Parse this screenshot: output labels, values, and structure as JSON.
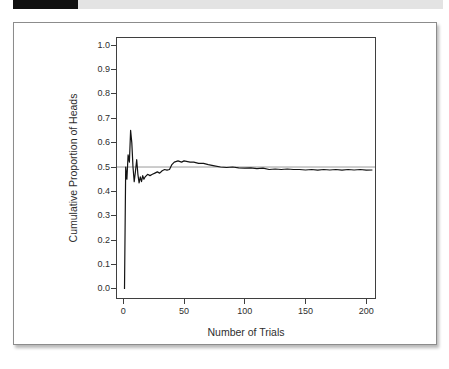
{
  "window": {
    "tab_color": "#101010",
    "bar_color": "#e3e3e3"
  },
  "chart_data": {
    "type": "line",
    "title": "",
    "xlabel": "Number of Trials",
    "ylabel": "Cumulative Proportion of Heads",
    "xlim": [
      -6,
      208
    ],
    "ylim": [
      -0.041,
      1.033
    ],
    "x_ticks": {
      "values": [
        0,
        50,
        100,
        150,
        200
      ],
      "labels": [
        "0",
        "50",
        "100",
        "150",
        "200"
      ]
    },
    "y_ticks": {
      "values": [
        0.0,
        0.1,
        0.2,
        0.3,
        0.4,
        0.5,
        0.6,
        0.7,
        0.8,
        0.9,
        1.0
      ],
      "labels": [
        "0.0",
        "0.1",
        "0.2",
        "0.3",
        "0.4",
        "0.5",
        "0.6",
        "0.7",
        "0.8",
        "0.9",
        "1.0"
      ]
    },
    "grid": false,
    "legend": "none",
    "reference_line_y": 0.5,
    "reference_line_color": "#9a9a9a",
    "line_color": "#141414",
    "frame_color": "#3f3f3f",
    "series": [
      {
        "name": "cumulative-proportion-of-heads",
        "x": [
          1,
          2,
          3,
          4,
          5,
          6,
          7,
          8,
          9,
          10,
          11,
          12,
          13,
          14,
          15,
          16,
          17,
          18,
          20,
          22,
          24,
          26,
          28,
          30,
          32,
          34,
          36,
          38,
          40,
          42,
          45,
          48,
          50,
          55,
          58,
          62,
          66,
          70,
          75,
          80,
          85,
          90,
          95,
          100,
          105,
          110,
          115,
          120,
          125,
          130,
          135,
          140,
          145,
          150,
          155,
          160,
          165,
          170,
          175,
          180,
          185,
          190,
          195,
          200,
          205
        ],
        "y": [
          0.0,
          0.5,
          0.45,
          0.55,
          0.52,
          0.65,
          0.6,
          0.5,
          0.44,
          0.48,
          0.53,
          0.47,
          0.435,
          0.46,
          0.44,
          0.465,
          0.45,
          0.46,
          0.47,
          0.465,
          0.47,
          0.475,
          0.48,
          0.475,
          0.485,
          0.49,
          0.487,
          0.49,
          0.51,
          0.52,
          0.525,
          0.52,
          0.525,
          0.52,
          0.52,
          0.515,
          0.515,
          0.51,
          0.505,
          0.5,
          0.498,
          0.5,
          0.497,
          0.495,
          0.497,
          0.493,
          0.495,
          0.49,
          0.492,
          0.49,
          0.492,
          0.49,
          0.49,
          0.488,
          0.49,
          0.487,
          0.49,
          0.488,
          0.49,
          0.487,
          0.49,
          0.488,
          0.49,
          0.487,
          0.488
        ]
      }
    ]
  }
}
